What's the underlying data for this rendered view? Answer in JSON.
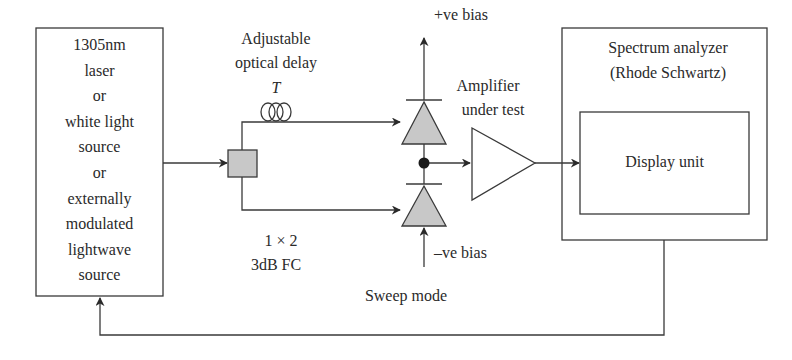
{
  "source_box": {
    "lines": [
      "1305nm",
      "laser",
      "or",
      "white light",
      "source",
      "or",
      "externally",
      "modulated",
      "lightwave",
      "source"
    ]
  },
  "delay": {
    "line1": "Adjustable",
    "line2": "optical delay",
    "symbol": "T"
  },
  "coupler": {
    "line1": "1 × 2",
    "line2": "3dB FC"
  },
  "bias": {
    "positive": "+ve bias",
    "negative": "–ve bias"
  },
  "amplifier": {
    "line1": "Amplifier",
    "line2": "under test"
  },
  "analyzer": {
    "line1": "Spectrum analyzer",
    "line2": "(Rhode Schwartz)",
    "display": "Display unit"
  },
  "sweep": {
    "label": "Sweep mode"
  },
  "colors": {
    "line": "#3a3a3a",
    "fill_gray": "#c8c8c8",
    "dot": "#1a1a1a"
  }
}
